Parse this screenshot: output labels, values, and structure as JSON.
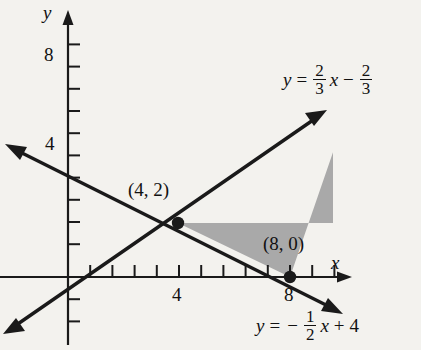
{
  "figure": {
    "type": "coordinate-graph",
    "background_color": "#f3f2ee",
    "line_color": "#1a1a1a",
    "shade_color": "#a9a9a9"
  },
  "axes": {
    "x_label": "x",
    "y_label": "y",
    "x_ticks": [
      {
        "value": 1,
        "label": ""
      },
      {
        "value": 2,
        "label": ""
      },
      {
        "value": 3,
        "label": ""
      },
      {
        "value": 4,
        "label": "4"
      },
      {
        "value": 5,
        "label": ""
      },
      {
        "value": 6,
        "label": ""
      },
      {
        "value": 7,
        "label": ""
      },
      {
        "value": 8,
        "label": "8"
      },
      {
        "value": 9,
        "label": ""
      },
      {
        "value": 10,
        "label": ""
      }
    ],
    "y_ticks": [
      {
        "value": -2,
        "label": ""
      },
      {
        "value": -1,
        "label": ""
      },
      {
        "value": 1,
        "label": ""
      },
      {
        "value": 2,
        "label": ""
      },
      {
        "value": 3,
        "label": ""
      },
      {
        "value": 4,
        "label": "4"
      },
      {
        "value": 5,
        "label": ""
      },
      {
        "value": 6,
        "label": ""
      },
      {
        "value": 7,
        "label": ""
      },
      {
        "value": 8,
        "label": "8"
      },
      {
        "value": 9,
        "label": ""
      }
    ],
    "x_tick_labels_shown": [
      "4",
      "8"
    ],
    "y_tick_labels_shown": [
      "4",
      "8"
    ],
    "origin_px": {
      "x": 68,
      "y": 277
    },
    "unit_px": 22.2,
    "x_range": [
      -3,
      12.6
    ],
    "y_range": [
      -3.6,
      10.5
    ]
  },
  "lines": [
    {
      "id": "line-rising",
      "equation_text": "y = 2/3 x - 2/3",
      "slope_num": "2",
      "slope_den": "3",
      "intercept_num": "2",
      "intercept_den": "3",
      "intercept_sign": "−",
      "var": "x",
      "lhs": "y",
      "eq_sign": "=",
      "slope": 0.6667,
      "intercept": -0.6667,
      "x_intercept": 1,
      "arrows": [
        "both"
      ]
    },
    {
      "id": "line-falling",
      "equation_text": "y = - 1/2 x + 4",
      "leading_sign": "−",
      "slope_num": "1",
      "slope_den": "2",
      "constant": "4",
      "constant_sign": "+",
      "var": "x",
      "lhs": "y",
      "eq_sign": "=",
      "slope": -0.5,
      "intercept": 4,
      "x_intercept": 8,
      "arrows": [
        "both"
      ]
    }
  ],
  "points": [
    {
      "id": "intersection-point",
      "label": "(4, 2)",
      "x": 4,
      "y": 2,
      "label_px": {
        "x": 128,
        "y": 186
      }
    },
    {
      "id": "x-intercept-point",
      "label": "(8, 0)",
      "x": 8,
      "y": 0,
      "label_px": {
        "x": 263,
        "y": 240
      }
    }
  ],
  "shaded_region": {
    "id": "solution-region",
    "color": "#a9a9a9",
    "vertices": [
      [
        4,
        2
      ],
      [
        8,
        0
      ],
      [
        12,
        4
      ]
    ],
    "note": "triangular region between the two lines, right edge clipped"
  },
  "equation_labels": {
    "rising_pos_px": {
      "x": 282,
      "y": 62
    },
    "falling_pos_px": {
      "x": 255,
      "y": 308
    }
  }
}
